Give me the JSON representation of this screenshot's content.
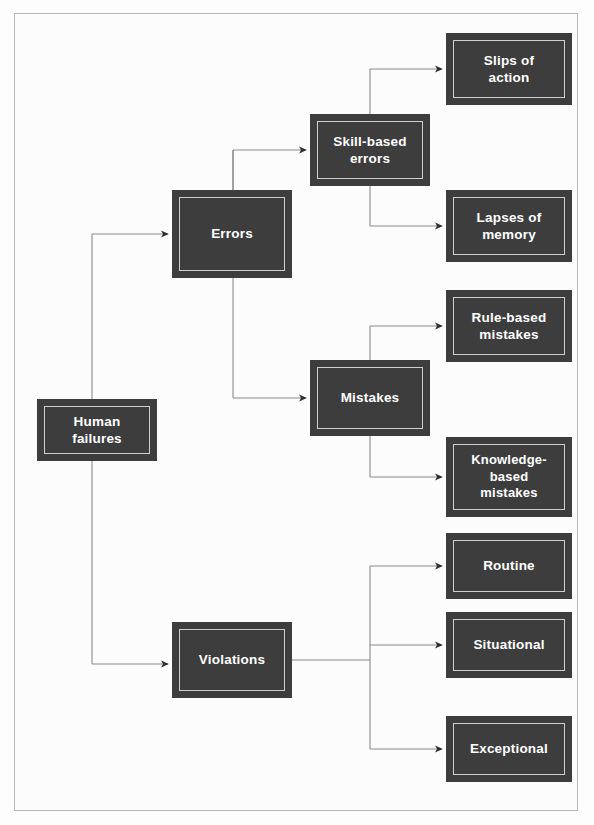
{
  "diagram": {
    "type": "tree-diagram",
    "colors": {
      "node_fill": "#3d3d3d",
      "node_inner_border": "#cfcfcf",
      "node_text": "#ffffff",
      "connector": "#8a8a8a",
      "page_background": "#fcfcfc",
      "frame_border": "#b9b9b9"
    },
    "nodes": [
      {
        "id": "human-failures",
        "label": "Human\nfailures",
        "x": 37,
        "y": 399,
        "w": 120,
        "h": 62
      },
      {
        "id": "errors",
        "label": "Errors",
        "x": 172,
        "y": 190,
        "w": 120,
        "h": 88
      },
      {
        "id": "violations",
        "label": "Violations",
        "x": 172,
        "y": 622,
        "w": 120,
        "h": 76
      },
      {
        "id": "skill-based-errors",
        "label": "Skill-based\nerrors",
        "x": 310,
        "y": 114,
        "w": 120,
        "h": 72
      },
      {
        "id": "mistakes",
        "label": "Mistakes",
        "x": 310,
        "y": 360,
        "w": 120,
        "h": 76
      },
      {
        "id": "slips-of-action",
        "label": "Slips of\naction",
        "x": 446,
        "y": 33,
        "w": 126,
        "h": 72
      },
      {
        "id": "lapses-of-memory",
        "label": "Lapses of\nmemory",
        "x": 446,
        "y": 190,
        "w": 126,
        "h": 72
      },
      {
        "id": "rule-based-mistakes",
        "label": "Rule-based\nmistakes",
        "x": 446,
        "y": 290,
        "w": 126,
        "h": 72
      },
      {
        "id": "knowledge-based",
        "label": "Knowledge-\nbased\nmistakes",
        "x": 446,
        "y": 437,
        "w": 126,
        "h": 80
      },
      {
        "id": "routine",
        "label": "Routine",
        "x": 446,
        "y": 533,
        "w": 126,
        "h": 66
      },
      {
        "id": "situational",
        "label": "Situational",
        "x": 446,
        "y": 612,
        "w": 126,
        "h": 66
      },
      {
        "id": "exceptional",
        "label": "Exceptional",
        "x": 446,
        "y": 716,
        "w": 126,
        "h": 66
      }
    ],
    "edges": [
      {
        "id": "human-failures-to-errors",
        "from": "human-failures",
        "to": "errors"
      },
      {
        "id": "human-failures-to-violations",
        "from": "human-failures",
        "to": "violations"
      },
      {
        "id": "errors-to-skill-based-errors",
        "from": "errors",
        "to": "skill-based-errors"
      },
      {
        "id": "errors-to-mistakes",
        "from": "errors",
        "to": "mistakes"
      },
      {
        "id": "skill-based-to-slips-of-action",
        "from": "skill-based-errors",
        "to": "slips-of-action"
      },
      {
        "id": "skill-based-to-lapses-of-memory",
        "from": "skill-based-errors",
        "to": "lapses-of-memory"
      },
      {
        "id": "mistakes-to-rule-based-mistakes",
        "from": "mistakes",
        "to": "rule-based-mistakes"
      },
      {
        "id": "mistakes-to-knowledge-based",
        "from": "mistakes",
        "to": "knowledge-based"
      },
      {
        "id": "violations-to-routine",
        "from": "violations",
        "to": "routine"
      },
      {
        "id": "violations-to-situational",
        "from": "violations",
        "to": "situational"
      },
      {
        "id": "violations-to-exceptional",
        "from": "violations",
        "to": "exceptional"
      }
    ]
  }
}
